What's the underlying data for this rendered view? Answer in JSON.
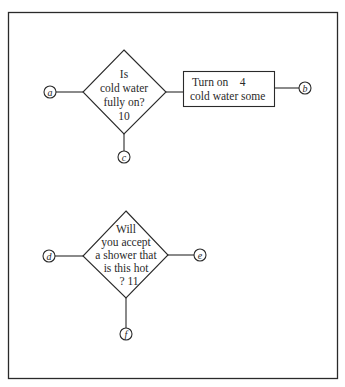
{
  "diagram": {
    "type": "flowchart",
    "nodes": [
      {
        "id": "decision-10",
        "shape": "diamond",
        "lines": [
          "Is",
          "cold water",
          "fully on?",
          "10"
        ]
      },
      {
        "id": "process-4",
        "shape": "rectangle",
        "lines": [
          "Turn on    4",
          "cold water some"
        ]
      },
      {
        "id": "decision-11",
        "shape": "diamond",
        "lines": [
          "Will",
          "you accept",
          "a shower that",
          "is this hot",
          "? 11"
        ]
      }
    ],
    "connectors": {
      "a": "a",
      "b": "b",
      "c": "c",
      "d": "d",
      "e": "e",
      "f": "f"
    },
    "edges": [
      [
        "a",
        "decision-10"
      ],
      [
        "decision-10",
        "process-4"
      ],
      [
        "process-4",
        "b"
      ],
      [
        "decision-10",
        "c"
      ],
      [
        "d",
        "decision-11"
      ],
      [
        "decision-11",
        "e"
      ],
      [
        "decision-11",
        "f"
      ]
    ],
    "colors": {
      "stroke": "#2a2a2a",
      "background": "#ffffff"
    }
  }
}
